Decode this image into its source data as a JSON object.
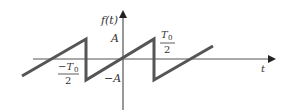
{
  "diagram": {
    "y_axis_label": "f(t)",
    "x_axis_label": "t",
    "labels": {
      "amplitude_pos": "A",
      "amplitude_neg": "−A",
      "neg_half_period_num": "−T",
      "neg_half_period_sub": "0",
      "neg_half_period_den": "2",
      "pos_half_period_num": "T",
      "pos_half_period_sub": "0",
      "pos_half_period_den": "2"
    },
    "colors": {
      "waveform": "#555555",
      "axes": "#444444",
      "text": "#333333"
    }
  }
}
